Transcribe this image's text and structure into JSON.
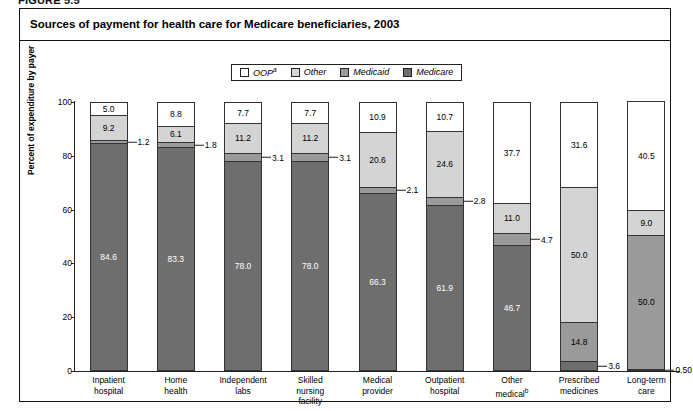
{
  "figure_label": "FIGURE 5.5",
  "chart_title": "Sources of payment for health care for Medicare beneficiaries, 2003",
  "legend": {
    "items": [
      {
        "label": "OOP",
        "sup": "a",
        "color": "#ffffff",
        "name": "legend-oop"
      },
      {
        "label": "Other",
        "sup": "",
        "color": "#d4d4d4",
        "name": "legend-other"
      },
      {
        "label": "Medicaid",
        "sup": "",
        "color": "#9a9a9a",
        "name": "legend-medicaid"
      },
      {
        "label": "Medicare",
        "sup": "",
        "color": "#6e6e6e",
        "name": "legend-medicare"
      }
    ]
  },
  "chart_data": {
    "type": "bar",
    "subtype": "stacked-100-percent",
    "title": "Sources of payment for health care for Medicare beneficiaries, 2003",
    "xlabel": "",
    "ylabel": "Percent of expenditure by payer",
    "ylim": [
      0,
      100
    ],
    "yticks": [
      0,
      20,
      40,
      60,
      80,
      100
    ],
    "grid": false,
    "legend_position": "top-center",
    "categories": [
      "Inpatient hospital",
      "Home health",
      "Independent labs",
      "Skilled nursing facility",
      "Medical provider",
      "Outpatient hospital",
      "Other medical",
      "Prescribed medicines",
      "Long-term care"
    ],
    "category_footnotes": [
      "",
      "",
      "",
      "",
      "",
      "",
      "b",
      "",
      ""
    ],
    "series": [
      {
        "name": "Medicare",
        "color": "#6e6e6e",
        "text_color": "#ffffff",
        "values": [
          84.6,
          83.3,
          78.0,
          78.0,
          66.3,
          61.9,
          46.7,
          3.6,
          0.5
        ],
        "labels": [
          "84.6",
          "83.3",
          "78.0",
          "78.0",
          "66.3",
          "61.9",
          "46.7",
          "3.6",
          "0.50"
        ]
      },
      {
        "name": "Medicaid",
        "color": "#9a9a9a",
        "text_color": "#000000",
        "values": [
          1.2,
          1.8,
          3.1,
          3.1,
          2.1,
          2.8,
          4.7,
          14.8,
          50.0
        ],
        "labels": [
          "1.2",
          "1.8",
          "3.1",
          "3.1",
          "2.1",
          "2.8",
          "4.7",
          "14.8",
          "50.0"
        ]
      },
      {
        "name": "Other",
        "color": "#d4d4d4",
        "text_color": "#000000",
        "values": [
          9.2,
          6.1,
          11.2,
          11.2,
          20.6,
          24.6,
          11.0,
          50.0,
          9.0
        ],
        "labels": [
          "9.2",
          "6.1",
          "11.2",
          "11.2",
          "20.6",
          "24.6",
          "11.0",
          "50.0",
          "9.0"
        ]
      },
      {
        "name": "OOP",
        "color": "#ffffff",
        "text_color": "#000000",
        "values": [
          5.0,
          8.8,
          7.7,
          7.7,
          10.9,
          10.7,
          37.7,
          31.6,
          40.5
        ],
        "labels": [
          "5.0",
          "8.8",
          "7.7",
          "7.7",
          "10.9",
          "10.7",
          "37.7",
          "31.6",
          "40.5"
        ]
      }
    ]
  },
  "xlabels_wrapped": [
    [
      "Inpatient",
      "hospital"
    ],
    [
      "Home",
      "health"
    ],
    [
      "Independent",
      "labs"
    ],
    [
      "Skilled",
      "nursing",
      "facility"
    ],
    [
      "Medical",
      "provider"
    ],
    [
      "Outpatient",
      "hospital"
    ],
    [
      "Other",
      "medical"
    ],
    [
      "Prescribed",
      "medicines"
    ],
    [
      "Long-term",
      "care"
    ]
  ]
}
